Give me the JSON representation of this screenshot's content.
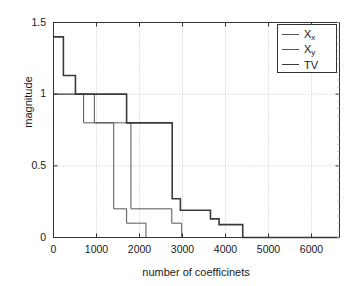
{
  "chart_data": {
    "type": "line",
    "subtype": "step",
    "title": "",
    "xlabel": "number of coefficinets",
    "ylabel": "magnitude",
    "xlim": [
      0,
      6650
    ],
    "ylim": [
      0,
      1.5
    ],
    "xticks": [
      0,
      1000,
      2000,
      3000,
      4000,
      5000,
      6000
    ],
    "xticklabels": [
      "0",
      "1000",
      "2000",
      "3000",
      "4000",
      "5000",
      "6000"
    ],
    "yticks": [
      0,
      0.5,
      1,
      1.5
    ],
    "yticklabels": [
      "0",
      "0.5",
      "1",
      "1.5"
    ],
    "grid": true,
    "grid_style": "dotted",
    "legend_position": "top-right",
    "series": [
      {
        "name": "X_x",
        "label_base": "X",
        "label_sub": "x",
        "color": "#555555",
        "linewidth": 1.0,
        "steps": [
          {
            "x": 0,
            "y": 1.0
          },
          {
            "x": 700,
            "y": 0.8
          },
          {
            "x": 1400,
            "y": 0.2
          },
          {
            "x": 1700,
            "y": 0.1
          },
          {
            "x": 2150,
            "y": 0.0
          },
          {
            "x": 6650,
            "y": 0.0
          }
        ]
      },
      {
        "name": "X_y",
        "label_base": "X",
        "label_sub": "y",
        "color": "#555555",
        "linewidth": 1.0,
        "steps": [
          {
            "x": 0,
            "y": 1.0
          },
          {
            "x": 950,
            "y": 0.8
          },
          {
            "x": 1600,
            "y": 0.8
          },
          {
            "x": 1800,
            "y": 0.2
          },
          {
            "x": 2750,
            "y": 0.1
          },
          {
            "x": 2980,
            "y": 0.0
          },
          {
            "x": 6650,
            "y": 0.0
          }
        ]
      },
      {
        "name": "TV",
        "label_base": "TV",
        "label_sub": "",
        "color": "#3a3a3a",
        "linewidth": 1.6,
        "steps": [
          {
            "x": 0,
            "y": 1.4
          },
          {
            "x": 200,
            "y": 1.4
          },
          {
            "x": 230,
            "y": 1.13
          },
          {
            "x": 480,
            "y": 1.13
          },
          {
            "x": 510,
            "y": 1.0
          },
          {
            "x": 1650,
            "y": 1.0
          },
          {
            "x": 1700,
            "y": 0.8
          },
          {
            "x": 2720,
            "y": 0.8
          },
          {
            "x": 2760,
            "y": 0.27
          },
          {
            "x": 2900,
            "y": 0.27
          },
          {
            "x": 2950,
            "y": 0.19
          },
          {
            "x": 3600,
            "y": 0.19
          },
          {
            "x": 3650,
            "y": 0.13
          },
          {
            "x": 3800,
            "y": 0.13
          },
          {
            "x": 3850,
            "y": 0.09
          },
          {
            "x": 4380,
            "y": 0.09
          },
          {
            "x": 4400,
            "y": 0.0
          },
          {
            "x": 6650,
            "y": 0.0
          }
        ]
      }
    ],
    "legend_entries": [
      {
        "base": "X",
        "sub": "x"
      },
      {
        "base": "X",
        "sub": "y"
      },
      {
        "base": "TV",
        "sub": ""
      }
    ]
  },
  "axes": {
    "frame_color": "#333333",
    "grid_color": "#b9b9b9",
    "background": "#ffffff"
  }
}
